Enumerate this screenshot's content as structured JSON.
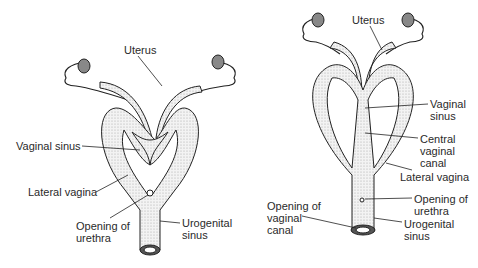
{
  "diagrams": [
    {
      "name": "left",
      "labels": {
        "uterus": "Uterus",
        "vaginal_sinus": "Vaginal sinus",
        "lateral_vagina": "Lateral vagina",
        "opening_urethra_1": "Opening of",
        "opening_urethra_2": "urethra",
        "urogenital_1": "Urogenital",
        "urogenital_2": "sinus"
      }
    },
    {
      "name": "right",
      "labels": {
        "uterus": "Uterus",
        "vaginal_sinus_1": "Vaginal",
        "vaginal_sinus_2": "sinus",
        "central_1": "Central",
        "central_2": "vaginal",
        "central_3": "canal",
        "lateral_vagina": "Lateral vagina",
        "opening_urethra_1": "Opening of",
        "opening_urethra_2": "urethra",
        "opening_vaginal_1": "Opening of",
        "opening_vaginal_2": "vaginal",
        "opening_vaginal_3": "canal",
        "urogenital_1": "Urogenital",
        "urogenital_2": "sinus"
      }
    }
  ]
}
